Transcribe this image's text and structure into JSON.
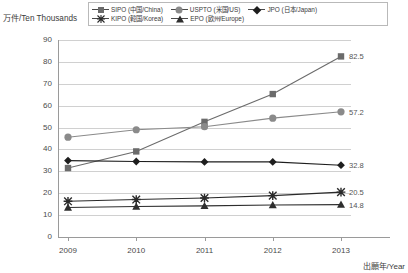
{
  "chart_data": {
    "type": "line",
    "title": "",
    "xlabel": "出願年/Year",
    "ylabel": "万件/Ten Thousands",
    "categories": [
      "2009",
      "2010",
      "2011",
      "2012",
      "2013"
    ],
    "ylim": [
      0,
      90
    ],
    "yticks": [
      "0",
      "10",
      "20",
      "30",
      "40",
      "50",
      "60",
      "70",
      "80",
      "90"
    ],
    "grid": true,
    "legend_position": "top",
    "series": [
      {
        "name": "SIPO (中国/China)",
        "marker": "square",
        "color": "#6b6b6b",
        "values": [
          31.5,
          39.1,
          52.6,
          65.3,
          82.5
        ],
        "end_label": "82.5"
      },
      {
        "name": "USPTO (米国/US)",
        "marker": "circle",
        "color": "#8a8a8a",
        "values": [
          45.6,
          49.0,
          50.4,
          54.3,
          57.2
        ],
        "end_label": "57.2"
      },
      {
        "name": "JPO (日本/Japan)",
        "marker": "diamond",
        "color": "#1e1e1e",
        "values": [
          34.9,
          34.5,
          34.3,
          34.3,
          32.8
        ],
        "end_label": "32.8"
      },
      {
        "name": "KIPO (韓国/Korea)",
        "marker": "x",
        "color": "#2a2a2a",
        "values": [
          16.3,
          17.1,
          17.8,
          18.9,
          20.5
        ],
        "end_label": "20.5"
      },
      {
        "name": "EPO (欧州/Europe)",
        "marker": "triangle",
        "color": "#2e2e2e",
        "values": [
          13.5,
          13.9,
          14.2,
          14.6,
          14.8
        ],
        "end_label": "14.8"
      }
    ]
  }
}
